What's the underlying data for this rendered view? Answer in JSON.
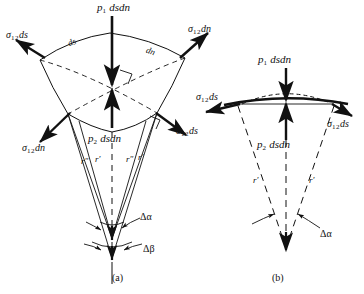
{
  "figure": {
    "type": "mechanics-force-balance-diagram",
    "panels": [
      {
        "id": "a",
        "caption": "(a)",
        "labels": {
          "p1": "p",
          "p1_sub": "1",
          "p1_rest": " dsdn",
          "p2": "p",
          "p2_sub": "2",
          "p2_rest": " dsdn",
          "sigma": "σ",
          "sigma_sub": "12",
          "ds_suffix": "ds",
          "dn_suffix": "dn",
          "edge_ds": "ds",
          "edge_dn": "dn",
          "r_prime": "r′",
          "r_double_prime": "r″",
          "delta_alpha": "Δα",
          "delta_beta": "Δβ"
        },
        "force_labels": [
          {
            "name": "sigma-12-ds-top-left",
            "text": "σ",
            "sub": "12",
            "rest": "ds"
          },
          {
            "name": "sigma-12-dn-top-right",
            "text": "σ",
            "sub": "12",
            "rest": "dn"
          },
          {
            "name": "sigma-12-dn-bottom-left",
            "text": "σ",
            "sub": "12",
            "rest": "dn"
          },
          {
            "name": "sigma-12-ds-bottom-right",
            "text": "σ",
            "sub": "12",
            "rest": "ds"
          }
        ],
        "angles": [
          "Δα",
          "Δβ"
        ],
        "radii": [
          "r′",
          "r″",
          "r′",
          "r″"
        ]
      },
      {
        "id": "b",
        "caption": "(b)",
        "labels": {
          "p1": "p",
          "p1_sub": "1",
          "p1_rest": " dsdn",
          "p2": "p",
          "p2_sub": "2",
          "p2_rest": " dsdn",
          "sigma": "σ",
          "sigma_sub": "12",
          "ds_suffix": "ds",
          "r_prime": "r′",
          "delta_alpha": "Δα"
        },
        "force_labels": [
          {
            "name": "sigma-12-ds-left",
            "text": "σ",
            "sub": "12",
            "rest": "ds"
          },
          {
            "name": "sigma-12-ds-right",
            "text": "σ",
            "sub": "12",
            "rest": "ds"
          }
        ],
        "angles": [
          "Δα"
        ],
        "radii": [
          "r′",
          "r′"
        ]
      }
    ],
    "colors": {
      "stroke": "#111111",
      "background": "#ffffff"
    }
  }
}
